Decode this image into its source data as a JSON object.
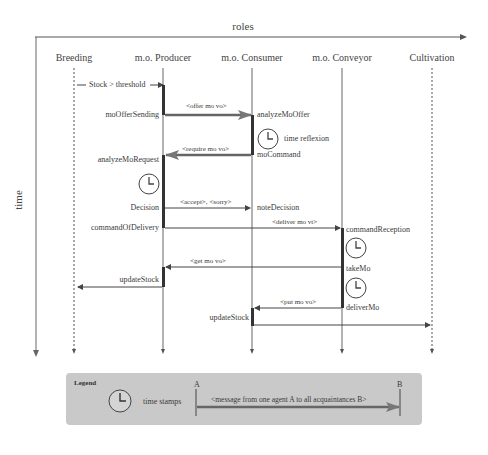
{
  "axes": {
    "horizontal_label": "roles",
    "vertical_label": "time"
  },
  "roles": [
    {
      "name": "Breeding",
      "x": 74,
      "style": "dashed"
    },
    {
      "name": "m.o. Producer",
      "x": 163,
      "style": "solid"
    },
    {
      "name": "m.o. Consumer",
      "x": 252,
      "style": "solid"
    },
    {
      "name": "m.o. Conveyor",
      "x": 342,
      "style": "solid"
    },
    {
      "name": "Cultivation",
      "x": 432,
      "style": "dashed"
    }
  ],
  "events": {
    "stock_threshold": "Stock > threshold",
    "mo_offer_sending": "moOfferSending",
    "analyze_mo_offer": "analyzeMoOffer",
    "time_reflexion": "time reflexion",
    "mo_command": "moCommand",
    "analyze_mo_request": "analyzeMoRequest",
    "decision": "Decision",
    "note_decision": "noteDecision",
    "command_of_delivery": "commandOfDelivery",
    "command_reception": "commandReception",
    "take_mo": "takeMo",
    "deliver_mo": "deliverMo",
    "update_stock_producer": "updateStock",
    "update_stock_consumer": "updateStock"
  },
  "messages": [
    {
      "label": "<offer mo vo>",
      "from": "m.o. Producer",
      "to": "m.o. Consumer",
      "type": "broadcast"
    },
    {
      "label": "<require mo vo>",
      "from": "m.o. Consumer",
      "to": "m.o. Producer",
      "type": "broadcast"
    },
    {
      "label": "<accept>, <sorry>",
      "from": "m.o. Producer",
      "to": "m.o. Consumer",
      "type": "direct"
    },
    {
      "label": "<deliver mo vt>",
      "from": "m.o. Producer",
      "to": "m.o. Conveyor",
      "type": "direct"
    },
    {
      "label": "<get mo vo>",
      "from": "m.o. Conveyor",
      "to": "m.o. Producer",
      "type": "direct"
    },
    {
      "label": "<put mo vo>",
      "from": "m.o. Conveyor",
      "to": "m.o. Consumer",
      "type": "direct"
    }
  ],
  "legend": {
    "title": "Legend",
    "time_stamps": "time stamps",
    "agent_a": "A",
    "agent_b": "B",
    "message_example": "<message from one agent A to all acquaintances B>"
  }
}
